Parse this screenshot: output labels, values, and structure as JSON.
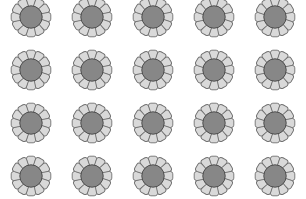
{
  "grid": {
    "rows": 4,
    "cols": 5,
    "col_centers": [
      31,
      92,
      153,
      214,
      275
    ],
    "row_centers": [
      17,
      70,
      123,
      176
    ],
    "item_icon": "flower-icon",
    "petal_count": 12
  },
  "colors": {
    "background": "#ffffff",
    "petal_fill": "#d9d9d9",
    "petal_stroke": "#6f6f6f",
    "center_fill": "#878787",
    "center_stroke": "#4f4f4f"
  }
}
